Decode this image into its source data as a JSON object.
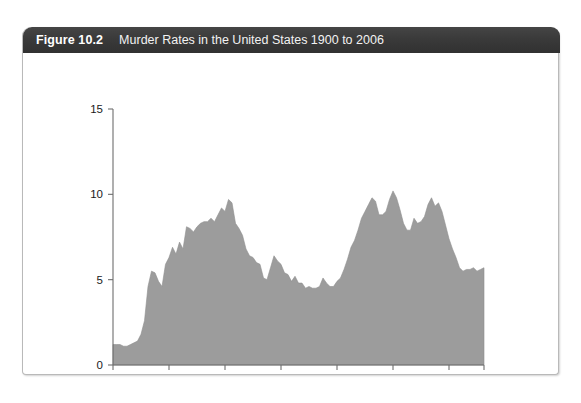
{
  "figure": {
    "number": "Figure 10.2",
    "title": "Murder Rates in the United States 1900 to 2006",
    "header_bg": "#3a3a3a",
    "header_text_color": "#ffffff",
    "card_bg": "#ffffff",
    "card_border": "#b9b9b9"
  },
  "chart_data": {
    "type": "area",
    "title": "Murder Rates in the United States 1900 to 2006",
    "xlabel": "",
    "ylabel": "",
    "xlim": [
      1900,
      2006
    ],
    "ylim": [
      0,
      15
    ],
    "grid": false,
    "legend": null,
    "fill_color": "#9c9c9c",
    "line_color": "#8f8f8f",
    "axis_color": "#6d6d6d",
    "x_ticks": [
      1900,
      1916,
      1932,
      1948,
      1964,
      1980,
      1996,
      2006
    ],
    "x_tick_labels": [
      "1900",
      "1916",
      "1932",
      "1948",
      "1964",
      "1980",
      "1996",
      "2006"
    ],
    "y_ticks": [
      0,
      5,
      10,
      15
    ],
    "y_tick_labels": [
      "0",
      "5",
      "10",
      "15"
    ],
    "series": [
      {
        "name": "Murder rate per 100,000",
        "x": [
          1900,
          1901,
          1902,
          1903,
          1904,
          1905,
          1906,
          1907,
          1908,
          1909,
          1910,
          1911,
          1912,
          1913,
          1914,
          1915,
          1916,
          1917,
          1918,
          1919,
          1920,
          1921,
          1922,
          1923,
          1924,
          1925,
          1926,
          1927,
          1928,
          1929,
          1930,
          1931,
          1932,
          1933,
          1934,
          1935,
          1936,
          1937,
          1938,
          1939,
          1940,
          1941,
          1942,
          1943,
          1944,
          1945,
          1946,
          1947,
          1948,
          1949,
          1950,
          1951,
          1952,
          1953,
          1954,
          1955,
          1956,
          1957,
          1958,
          1959,
          1960,
          1961,
          1962,
          1963,
          1964,
          1965,
          1966,
          1967,
          1968,
          1969,
          1970,
          1971,
          1972,
          1973,
          1974,
          1975,
          1976,
          1977,
          1978,
          1979,
          1980,
          1981,
          1982,
          1983,
          1984,
          1985,
          1986,
          1987,
          1988,
          1989,
          1990,
          1991,
          1992,
          1993,
          1994,
          1995,
          1996,
          1997,
          1998,
          1999,
          2000,
          2001,
          2002,
          2003,
          2004,
          2005,
          2006
        ],
        "values": [
          1.2,
          1.2,
          1.2,
          1.1,
          1.1,
          1.2,
          1.3,
          1.4,
          1.8,
          2.6,
          4.6,
          5.5,
          5.4,
          4.9,
          4.6,
          5.9,
          6.3,
          6.9,
          6.5,
          7.2,
          6.8,
          8.1,
          8.0,
          7.8,
          8.1,
          8.3,
          8.4,
          8.4,
          8.6,
          8.4,
          8.8,
          9.2,
          9.0,
          9.7,
          9.5,
          8.3,
          8.0,
          7.6,
          6.8,
          6.4,
          6.3,
          6.0,
          5.9,
          5.1,
          5.0,
          5.7,
          6.4,
          6.1,
          5.9,
          5.4,
          5.3,
          4.9,
          5.2,
          4.8,
          4.8,
          4.5,
          4.6,
          4.5,
          4.5,
          4.6,
          5.1,
          4.8,
          4.6,
          4.6,
          4.9,
          5.1,
          5.6,
          6.2,
          6.9,
          7.3,
          7.9,
          8.6,
          9.0,
          9.4,
          9.8,
          9.6,
          8.8,
          8.8,
          9.0,
          9.7,
          10.2,
          9.8,
          9.1,
          8.3,
          7.9,
          7.9,
          8.6,
          8.3,
          8.4,
          8.7,
          9.4,
          9.8,
          9.3,
          9.5,
          9.0,
          8.2,
          7.4,
          6.8,
          6.3,
          5.7,
          5.5,
          5.6,
          5.6,
          5.7,
          5.5,
          5.6,
          5.7
        ]
      }
    ]
  }
}
